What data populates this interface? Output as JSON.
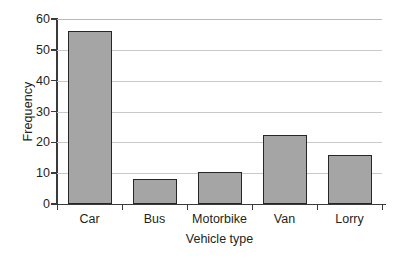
{
  "chart_data": {
    "type": "bar",
    "title": "",
    "xlabel": "Vehicle type",
    "ylabel": "Frequency",
    "categories": [
      "Car",
      "Bus",
      "Motorbike",
      "Van",
      "Lorry"
    ],
    "values": [
      56,
      8,
      10.5,
      22.5,
      16
    ],
    "ylim": [
      0,
      60
    ],
    "yticks": [
      0,
      10,
      20,
      30,
      40,
      50,
      60
    ],
    "ytick_labels": [
      "0",
      "10",
      "20",
      "30",
      "40",
      "50",
      "60"
    ],
    "grid": true,
    "grid_axis": "y",
    "legend": false,
    "legend_position": "none",
    "bar_fill_color": "#a5a5a5",
    "bar_edge_color": "#262626",
    "axis_color": "#3a3a3a",
    "grid_color": "#c9c9c9",
    "background_color": "#ffffff"
  }
}
